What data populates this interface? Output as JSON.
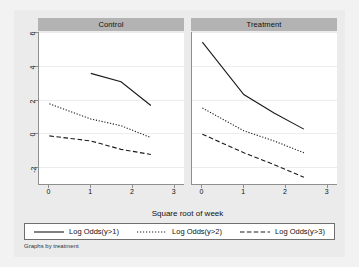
{
  "chart_data": {
    "type": "line",
    "title": "",
    "xlabel": "Square root of week",
    "ylabel": "",
    "xlim": [
      -0.25,
      3.25
    ],
    "ylim": [
      -2.6,
      6.4
    ],
    "xticks": [
      "0",
      "1",
      "2",
      "3"
    ],
    "xtick_values": [
      0,
      1,
      2,
      3
    ],
    "yticks": [
      "6",
      "4",
      "2",
      "0",
      "-2"
    ],
    "ytick_values": [
      6,
      4,
      2,
      0,
      -2
    ],
    "grid": true,
    "legend_position": "bottom",
    "note": "Graphs by treatment",
    "panels": [
      {
        "label": "Control",
        "series": [
          {
            "name": "Log Odds(y>1)",
            "style": "solid",
            "x": [
              1.0,
              1.73,
              2.45
            ],
            "y": [
              3.95,
              3.45,
              2.05
            ]
          },
          {
            "name": "Log Odds(y>2)",
            "style": "dotted",
            "x": [
              0.0,
              1.0,
              1.73,
              2.45
            ],
            "y": [
              2.15,
              1.25,
              0.85,
              0.15
            ]
          },
          {
            "name": "Log Odds(y>3)",
            "style": "dashed",
            "x": [
              0.0,
              1.0,
              1.73,
              2.45
            ],
            "y": [
              0.25,
              -0.05,
              -0.55,
              -0.85
            ]
          }
        ]
      },
      {
        "label": "Treatment",
        "series": [
          {
            "name": "Log Odds(y>1)",
            "style": "solid",
            "x": [
              0.0,
              1.0,
              1.73,
              2.45
            ],
            "y": [
              5.8,
              2.7,
              1.6,
              0.65
            ]
          },
          {
            "name": "Log Odds(y>2)",
            "style": "dotted",
            "x": [
              0.0,
              1.0,
              1.73,
              2.45
            ],
            "y": [
              1.9,
              0.55,
              -0.05,
              -0.75
            ]
          },
          {
            "name": "Log Odds(y>3)",
            "style": "dashed",
            "x": [
              0.0,
              1.0,
              1.73,
              2.45
            ],
            "y": [
              0.35,
              -0.75,
              -1.45,
              -2.2
            ]
          }
        ]
      }
    ],
    "legend": [
      {
        "label": "Log Odds(y>1)",
        "style": "solid"
      },
      {
        "label": "Log Odds(y>2)",
        "style": "dotted"
      },
      {
        "label": "Log Odds(y>3)",
        "style": "dashed"
      }
    ],
    "colors": {
      "line": "#1a1a1a",
      "figure_background": "#ebebeb",
      "plot_background": "#ffffff",
      "panel_header": "#b3b3b3",
      "gridline": "#ededed",
      "axis": "#8f8f8f"
    }
  }
}
